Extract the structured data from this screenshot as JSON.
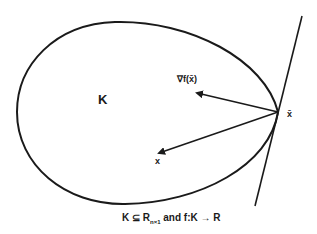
{
  "diagram": {
    "set_label": "K",
    "gradient_label": "∇f(x̄)",
    "point_x_label": "x",
    "point_xbar_label": "x̄",
    "caption": {
      "prefix": "K ⊆ R",
      "subscript": "n×1",
      "suffix": " and f:K → R"
    },
    "stroke_color": "#1a1a1a"
  }
}
